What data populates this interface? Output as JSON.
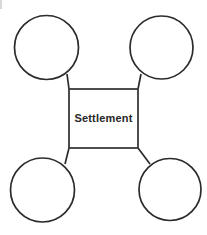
{
  "diagram": {
    "type": "hub-and-spoke",
    "background_color": "#ffffff",
    "stroke_color": "#2b2b2b",
    "center": {
      "label": "Settlement",
      "shape": "rectangle",
      "x": 69,
      "y": 89,
      "width": 69,
      "height": 59,
      "text_color": "#262626",
      "fill_color": "#ffffff"
    },
    "nodes": [
      {
        "id": "node-top-left",
        "label": "",
        "shape": "circle",
        "cx": 46.5,
        "cy": 47.5,
        "r": 32.0
      },
      {
        "id": "node-top-right",
        "label": "",
        "shape": "circle",
        "cx": 161.5,
        "cy": 47.5,
        "r": 31.5
      },
      {
        "id": "node-bottom-left",
        "label": "",
        "shape": "circle",
        "cx": 42.5,
        "cy": 190.0,
        "r": 32.0
      },
      {
        "id": "node-bottom-right",
        "label": "",
        "shape": "circle",
        "cx": 170.0,
        "cy": 189.5,
        "r": 31.0
      }
    ],
    "connectors": [
      {
        "id": "connector-top-left",
        "from": "center-corner-top-left",
        "to": "node-top-left",
        "x1": 69,
        "y1": 89,
        "x2": 69,
        "y2": 75
      },
      {
        "id": "connector-top-right",
        "from": "center-corner-top-right",
        "to": "node-top-right",
        "x1": 138,
        "y1": 89,
        "x2": 139,
        "y2": 75
      },
      {
        "id": "connector-bottom-left",
        "from": "center-corner-bottom-left",
        "to": "node-bottom-left",
        "x1": 69,
        "y1": 148,
        "x2": 66,
        "y2": 163
      },
      {
        "id": "connector-bottom-right",
        "from": "center-corner-bottom-right",
        "to": "node-bottom-right",
        "x1": 138,
        "y1": 148,
        "x2": 148,
        "y2": 163
      }
    ]
  }
}
